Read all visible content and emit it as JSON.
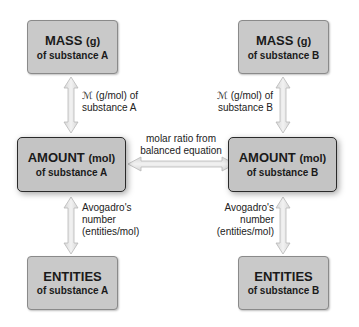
{
  "boxes": {
    "mass_a": {
      "title": "MASS",
      "unit": "(g)",
      "sub": "of substance A"
    },
    "mass_b": {
      "title": "MASS",
      "unit": "(g)",
      "sub": "of substance B"
    },
    "amount_a": {
      "title": "AMOUNT",
      "unit": "(mol)",
      "sub": "of substance A"
    },
    "amount_b": {
      "title": "AMOUNT",
      "unit": "(mol)",
      "sub": "of substance B"
    },
    "entities_a": {
      "title": "ENTITIES",
      "sub": "of substance A"
    },
    "entities_b": {
      "title": "ENTITIES",
      "sub": "of substance B"
    }
  },
  "labels": {
    "molar_mass_a": [
      "ℳ (g/mol) of",
      "substance A"
    ],
    "molar_mass_b": [
      "ℳ (g/mol) of",
      "substance B"
    ],
    "molar_ratio": [
      "molar ratio from",
      "balanced equation"
    ],
    "avogadro_a": [
      "Avogadro's",
      "number",
      "(entities/mol)"
    ],
    "avogadro_b": [
      "Avogadro's",
      "number",
      "(entities/mol)"
    ]
  },
  "colors": {
    "box_fill": "#c9c9c9",
    "arrow_fill": "#e2e2e2",
    "arrow_stroke": "#b8b8b8"
  }
}
